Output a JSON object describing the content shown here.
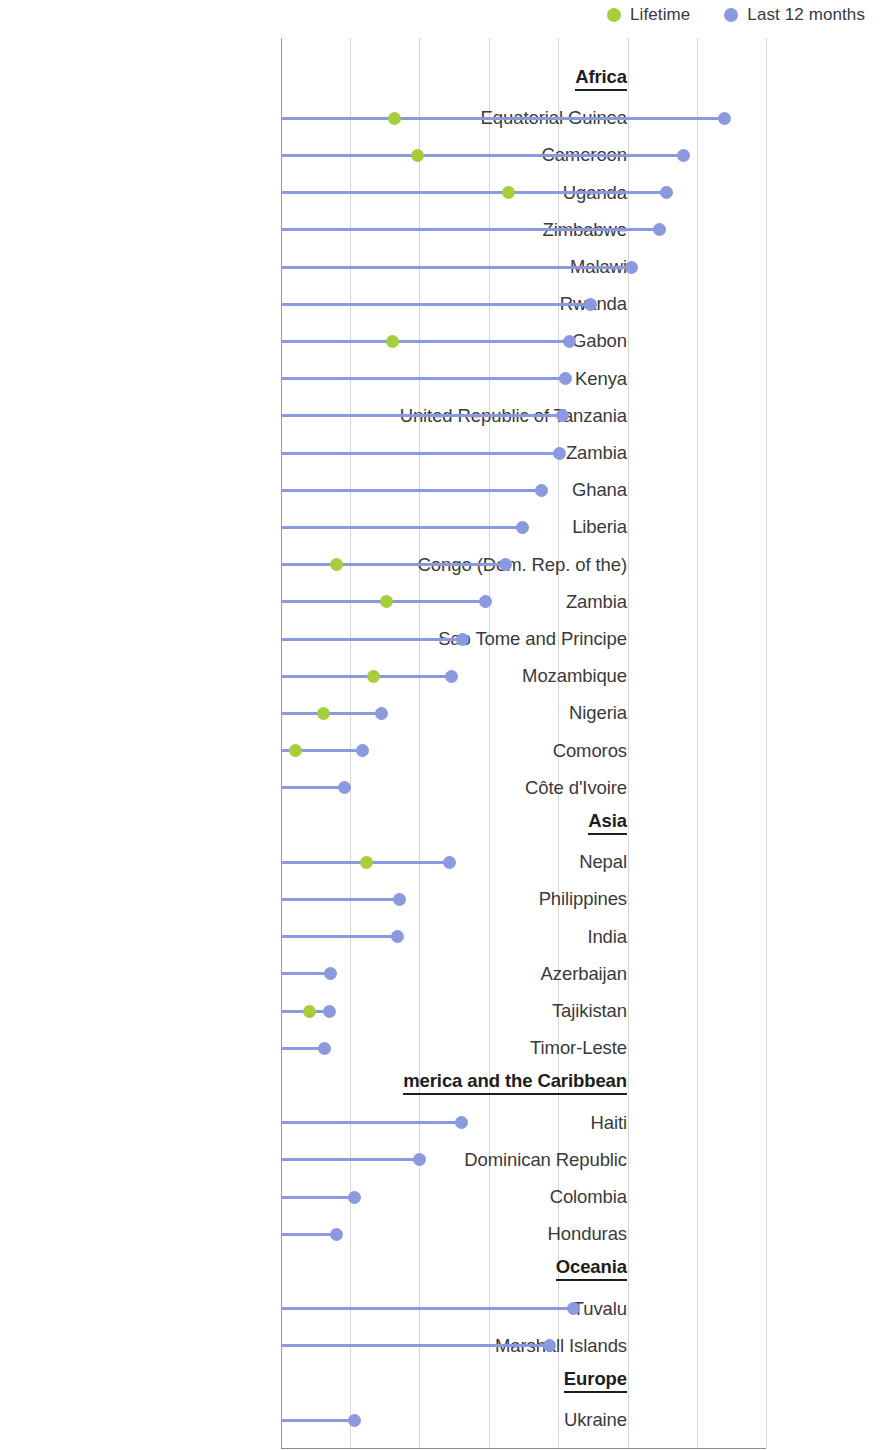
{
  "legend": {
    "items": [
      {
        "label": "Lifetime",
        "color": "#a5ce3a",
        "icon": "circle-marker-icon"
      },
      {
        "label": "Last 12 months",
        "color": "#8b9ade",
        "icon": "circle-marker-icon"
      }
    ]
  },
  "colors": {
    "lifetime": "#a5ce3a",
    "last_12_months": "#8b9ade",
    "stem": "#8b9ade",
    "gridline": "#d6d6d6",
    "axis": "#8c8c8c",
    "text": "#3a3a3a"
  },
  "chart_data": {
    "type": "bar",
    "subtype": "lollipop-horizontal",
    "title": "",
    "subtitle": "",
    "xlabel": "",
    "ylabel": "",
    "xlim": [
      0,
      35
    ],
    "xticks": [
      0,
      5,
      10,
      15,
      20,
      25,
      30,
      35
    ],
    "xtick_labels": [
      "0",
      "5",
      "10",
      "15",
      "20",
      "25",
      "30",
      "35"
    ],
    "grid": "vertical",
    "legend_position": "top-right",
    "series": [
      {
        "name": "Lifetime",
        "color": "#a5ce3a"
      },
      {
        "name": "Last 12 months",
        "color": "#8b9ade"
      }
    ],
    "groups": [
      {
        "name": "Africa",
        "rows": [
          {
            "label": "Equatorial Guinea",
            "last_12_months": 32.0,
            "lifetime": 8.2
          },
          {
            "label": "Cameroon",
            "last_12_months": 29.0,
            "lifetime": 9.9
          },
          {
            "label": "Uganda",
            "last_12_months": 27.8,
            "lifetime": 16.4
          },
          {
            "label": "Zimbabwe",
            "last_12_months": 27.3,
            "lifetime": null
          },
          {
            "label": "Malawi",
            "last_12_months": 25.3,
            "lifetime": null
          },
          {
            "label": "Rwanda",
            "last_12_months": 22.3,
            "lifetime": null
          },
          {
            "label": "Gabon",
            "last_12_months": 20.8,
            "lifetime": 8.1
          },
          {
            "label": "Kenya",
            "last_12_months": 20.5,
            "lifetime": null
          },
          {
            "label": "United Republic of Tanzania",
            "last_12_months": 20.3,
            "lifetime": null
          },
          {
            "label": "Zambia",
            "last_12_months": 20.1,
            "lifetime": null
          },
          {
            "label": "Ghana",
            "last_12_months": 18.8,
            "lifetime": null
          },
          {
            "label": "Liberia",
            "last_12_months": 17.4,
            "lifetime": null
          },
          {
            "label": "Congo (Dem. Rep. of the)",
            "last_12_months": 16.2,
            "lifetime": 4.0
          },
          {
            "label": "Zambia",
            "last_12_months": 14.8,
            "lifetime": 7.6
          },
          {
            "label": "Sao Tome and Principe",
            "last_12_months": 13.1,
            "lifetime": null
          },
          {
            "label": "Mozambique",
            "last_12_months": 12.3,
            "lifetime": 6.7
          },
          {
            "label": "Nigeria",
            "last_12_months": 7.3,
            "lifetime": 3.1
          },
          {
            "label": "Comoros",
            "last_12_months": 5.9,
            "lifetime": 1.1
          },
          {
            "label": "Côte d'Ivoire",
            "last_12_months": 4.6,
            "lifetime": null
          }
        ]
      },
      {
        "name": "Asia",
        "rows": [
          {
            "label": "Nepal",
            "last_12_months": 12.2,
            "lifetime": 6.2
          },
          {
            "label": "Philippines",
            "last_12_months": 8.6,
            "lifetime": null
          },
          {
            "label": "India",
            "last_12_months": 8.4,
            "lifetime": null
          },
          {
            "label": "Azerbaijan",
            "last_12_months": 3.6,
            "lifetime": null
          },
          {
            "label": "Tajikistan",
            "last_12_months": 3.5,
            "lifetime": 2.1
          },
          {
            "label": "Timor-Leste",
            "last_12_months": 3.2,
            "lifetime": null
          }
        ]
      },
      {
        "name": "Latin America and the Caribbean",
        "name_visible": "merica and the Caribbean",
        "rows": [
          {
            "label": "Haiti",
            "last_12_months": 13.0,
            "lifetime": null
          },
          {
            "label": "Dominican Republic",
            "last_12_months": 10.0,
            "lifetime": null
          },
          {
            "label": "Colombia",
            "last_12_months": 5.3,
            "lifetime": null
          },
          {
            "label": "Honduras",
            "last_12_months": 4.0,
            "lifetime": null
          }
        ]
      },
      {
        "name": "Oceania",
        "rows": [
          {
            "label": "Tuvalu",
            "last_12_months": 21.1,
            "lifetime": null
          },
          {
            "label": "Marshall Islands",
            "last_12_months": 19.4,
            "lifetime": null
          }
        ]
      },
      {
        "name": "Europe",
        "rows": [
          {
            "label": "Ukraine",
            "last_12_months": 5.3,
            "lifetime": null
          }
        ]
      }
    ]
  }
}
